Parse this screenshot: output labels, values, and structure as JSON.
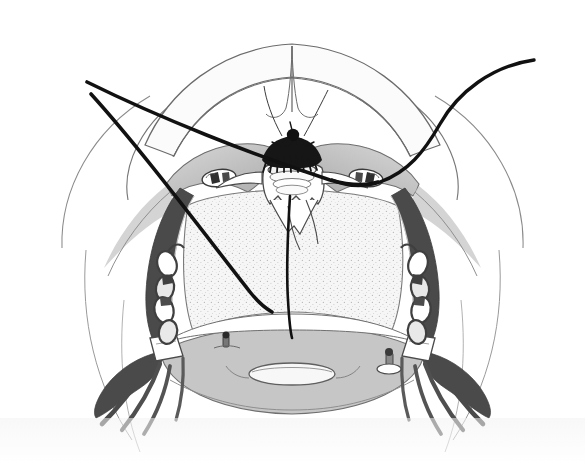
{
  "figure": {
    "domain": "medical-surgical-illustration",
    "title": "Transoral view of oral cavity with suture threads and lateral chain retractors",
    "caption": "",
    "view": "intraoral anterior view",
    "background_color": "#ffffff",
    "canvas": {
      "width": 585,
      "height": 463
    }
  },
  "palette": {
    "background": "#ffffff",
    "outline": "#4a4a4a",
    "outline_dark": "#2b2b2b",
    "suture_black": "#111111",
    "tissue_light": "#f4f4f4",
    "tissue_stipple": "#ededed",
    "tissue_mid_gray": "#c9c9c9",
    "tissue_dark_gray": "#9a9a9a",
    "shadow_dark": "#5d5d5d",
    "wedge_dark": "#4f4f4f",
    "knot_black": "#161616",
    "highlight_white": "#ffffff"
  },
  "anatomy": {
    "parts": [
      {
        "id": "upper-lip-arch",
        "label": "Upper lip / maxillary arch outline"
      },
      {
        "id": "central-incisors",
        "label": "Upper central incisors"
      },
      {
        "id": "palatal-vault",
        "label": "Palatal vault"
      },
      {
        "id": "left-palatal-arch",
        "label": "Left palatal arch (shaded)"
      },
      {
        "id": "right-palatal-arch",
        "label": "Right palatal arch (shaded)"
      },
      {
        "id": "pharyngeal-field",
        "label": "Stippled pharyngeal field"
      },
      {
        "id": "tongue-base",
        "label": "Tongue base / floor of mouth"
      },
      {
        "id": "glottic-opening",
        "label": "Central oval opening"
      },
      {
        "id": "left-cheek-wall",
        "label": "Left cheek / buccal wall"
      },
      {
        "id": "right-cheek-wall",
        "label": "Right cheek / buccal wall"
      }
    ]
  },
  "instruments": {
    "suture_threads": [
      {
        "id": "thread-upper-left-a",
        "label": "Upper-left suture thread A",
        "stroke_width": 3.6
      },
      {
        "id": "thread-upper-left-b",
        "label": "Upper-left suture thread B",
        "stroke_width": 3.6
      },
      {
        "id": "thread-right-curved",
        "label": "Right curved suture thread",
        "stroke_width": 3.4
      },
      {
        "id": "thread-midline",
        "label": "Midline descending suture thread",
        "stroke_width": 2.6
      },
      {
        "id": "thread-fine-left",
        "label": "Fine left guide thread",
        "stroke_width": 1.0
      },
      {
        "id": "thread-fine-right",
        "label": "Fine right guide thread",
        "stroke_width": 1.0
      }
    ],
    "knot": {
      "id": "central-suture-knot",
      "label": "Central suture knot cluster"
    },
    "clips": [
      {
        "id": "clip-left",
        "label": "Left oval surgical clip"
      },
      {
        "id": "clip-right",
        "label": "Right oval surgical clip"
      }
    ],
    "chains": [
      {
        "id": "chain-left",
        "label": "Left lateral retractor chain",
        "link_count": 4
      },
      {
        "id": "chain-right",
        "label": "Right lateral retractor chain",
        "link_count": 4
      }
    ],
    "posts": [
      {
        "id": "post-left",
        "label": "Left anchor post"
      },
      {
        "id": "post-right",
        "label": "Right anchor post"
      }
    ],
    "wedges": [
      {
        "id": "wedge-left",
        "label": "Left dark retractor wedge with spikes",
        "spike_count": 3
      },
      {
        "id": "wedge-right",
        "label": "Right dark retractor wedge with spikes",
        "spike_count": 3
      }
    ]
  }
}
